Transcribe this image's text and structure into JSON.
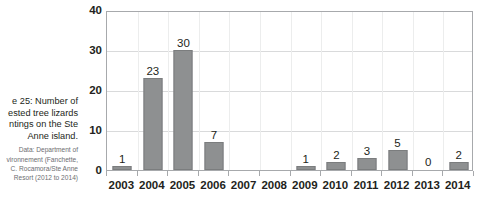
{
  "caption": {
    "title_lines": [
      "e 25: Number of",
      "ested tree lizards",
      "ntings on the Ste",
      "Anne island."
    ],
    "source_lines": [
      "Data: Department of",
      "vironnement (Fanchette,",
      "C. Rocamora/Ste Anne",
      "Resort (2012 to 2014)"
    ]
  },
  "chart_data": {
    "type": "bar",
    "title": "",
    "xlabel": "",
    "ylabel": "",
    "categories": [
      "2003",
      "2004",
      "2005",
      "2006",
      "2007",
      "2008",
      "2009",
      "2010",
      "2011",
      "2012",
      "2013",
      "2014"
    ],
    "values": [
      1,
      23,
      30,
      7,
      null,
      null,
      1,
      2,
      3,
      5,
      0,
      2
    ],
    "value_labels": [
      "1",
      "23",
      "30",
      "7",
      "",
      "",
      "1",
      "2",
      "3",
      "5",
      "0",
      "2"
    ],
    "ylim": [
      0,
      40
    ],
    "yticks": [
      0,
      10,
      20,
      30,
      40
    ],
    "ytick_labels": [
      "0",
      "10",
      "20",
      "30",
      "40"
    ],
    "grid": true,
    "legend": "none",
    "bar_color": "#8e9091",
    "grid_color": "#d9dadb",
    "axis_color": "#a7a9ac",
    "text_color": "#231f20"
  }
}
